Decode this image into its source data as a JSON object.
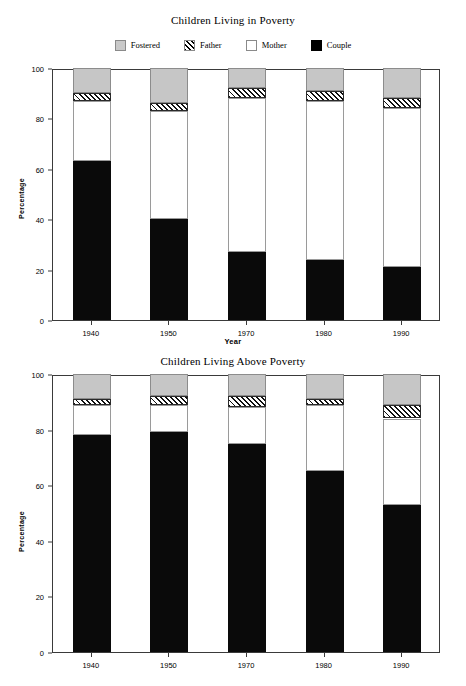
{
  "legend": {
    "items": [
      {
        "label": "Fostered",
        "key": "fostered",
        "color": "#c6c6c6",
        "swatch": "fostered-swatch"
      },
      {
        "label": "Father",
        "key": "father",
        "color": "#ffffff",
        "swatch": "father-swatch"
      },
      {
        "label": "Mother",
        "key": "mother",
        "color": "#ffffff",
        "swatch": "mother-swatch"
      },
      {
        "label": "Couple",
        "key": "couple",
        "color": "#000000",
        "swatch": "couple-swatch"
      }
    ]
  },
  "panels": {
    "top": {
      "title": "Children Living in Poverty",
      "ylabel": "Percentage",
      "xlabel": "Year"
    },
    "bottom": {
      "title": "Children Living Above Poverty",
      "ylabel": "Percentage",
      "xlabel": ""
    }
  },
  "axis": {
    "yticks": [
      "0",
      "20",
      "40",
      "60",
      "80",
      "100"
    ],
    "ytick_values": [
      0,
      20,
      40,
      60,
      80,
      100
    ],
    "ylim": [
      0,
      100
    ],
    "categories": [
      "1940",
      "1950",
      "1970",
      "1980",
      "1990"
    ]
  },
  "chart_data": [
    {
      "type": "bar",
      "stacked": true,
      "title": "Children Living in Poverty",
      "xlabel": "Year",
      "ylabel": "Percentage",
      "ylim": [
        0,
        100
      ],
      "grid": false,
      "legend_position": "top-center",
      "categories": [
        "1940",
        "1950",
        "1970",
        "1980",
        "1990"
      ],
      "series": [
        {
          "name": "Couple",
          "values": [
            63,
            40,
            27,
            24,
            21
          ]
        },
        {
          "name": "Mother",
          "values": [
            24,
            43,
            61,
            63,
            63
          ]
        },
        {
          "name": "Father",
          "values": [
            3,
            3,
            4,
            4,
            4
          ]
        },
        {
          "name": "Fostered",
          "values": [
            10,
            14,
            8,
            9,
            12
          ]
        }
      ],
      "cumulative_tops": {
        "1940": {
          "couple": 63,
          "mother": 87,
          "father": 90,
          "fostered": 100
        },
        "1950": {
          "couple": 40,
          "mother": 83,
          "father": 86,
          "fostered": 100
        },
        "1970": {
          "couple": 27,
          "mother": 88,
          "father": 92,
          "fostered": 100
        },
        "1980": {
          "couple": 24,
          "mother": 87,
          "father": 91,
          "fostered": 100
        },
        "1990": {
          "couple": 21,
          "mother": 84,
          "father": 88,
          "fostered": 100
        }
      }
    },
    {
      "type": "bar",
      "stacked": true,
      "title": "Children Living Above Poverty",
      "xlabel": "",
      "ylabel": "Percentage",
      "ylim": [
        0,
        100
      ],
      "grid": false,
      "legend_position": "none",
      "categories": [
        "1940",
        "1950",
        "1970",
        "1980",
        "1990"
      ],
      "series": [
        {
          "name": "Couple",
          "values": [
            78,
            79,
            75,
            65,
            53
          ]
        },
        {
          "name": "Mother",
          "values": [
            11,
            10,
            13,
            24,
            31
          ]
        },
        {
          "name": "Father",
          "values": [
            2,
            3,
            4,
            2,
            5
          ]
        },
        {
          "name": "Fostered",
          "values": [
            9,
            8,
            8,
            9,
            11
          ]
        }
      ],
      "cumulative_tops": {
        "1940": {
          "couple": 78,
          "mother": 89,
          "father": 91,
          "fostered": 100
        },
        "1950": {
          "couple": 79,
          "mother": 89,
          "father": 92,
          "fostered": 100
        },
        "1970": {
          "couple": 75,
          "mother": 88,
          "father": 92,
          "fostered": 100
        },
        "1980": {
          "couple": 65,
          "mother": 89,
          "father": 91,
          "fostered": 100
        },
        "1990": {
          "couple": 53,
          "mother": 84,
          "father": 89,
          "fostered": 100
        }
      }
    }
  ]
}
